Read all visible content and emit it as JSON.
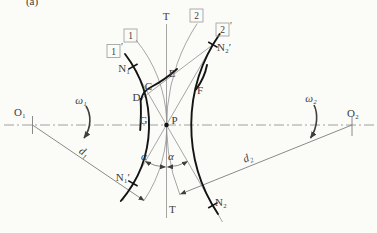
{
  "figure": {
    "caption_partial": "(a)"
  },
  "colors": {
    "background": "#fbfbf8",
    "thick_stroke": "#141414",
    "thin_stroke": "#7d7d7d",
    "text": "#3b3b3b"
  },
  "labels": {
    "t_top": "T",
    "t_bottom": "T",
    "o1": "O₁",
    "o2": "O₂",
    "omega1": "ω₁",
    "omega2": "ω₂",
    "d1": "d₁",
    "d2": "d₂",
    "alpha_left": "α",
    "alpha_right": "α",
    "n1": "N₁",
    "n1_prime": "N₁′",
    "n2": "N₂",
    "n2_prime": "N₂′",
    "p": "P",
    "c": "C",
    "d": "D",
    "e": "E",
    "f": "F",
    "g": "G",
    "box_1": "1",
    "box_1_prime": "1",
    "box_1_prime_mark": "′",
    "box_2": "2",
    "box_2_prime": "2",
    "box_2_prime_mark": "′",
    "caption": "(a)"
  }
}
